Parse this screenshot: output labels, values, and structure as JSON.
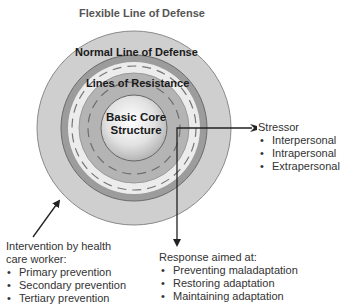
{
  "title": "Flexible Line of Defense",
  "rings": {
    "normal_line": "Normal Line of Defense",
    "lines_of_resistance": "Lines of Resistance",
    "core_line1": "Basic Core",
    "core_line2": "Structure"
  },
  "stressor": {
    "heading": "Stressor",
    "items": [
      "Interpersonal",
      "Intrapersonal",
      "Extrapersonal"
    ]
  },
  "intervention": {
    "heading_line1": "Intervention by health",
    "heading_line2": "care worker:",
    "items": [
      "Primary prevention",
      "Secondary prevention",
      "Tertiary prevention"
    ]
  },
  "response": {
    "heading": "Response aimed at:",
    "items": [
      "Preventing maladaptation",
      "Restoring adaptation",
      "Maintaining adaptation"
    ]
  },
  "colors": {
    "outer_ring": "#cfcfcf",
    "normal_line_ring": "#9a9a9a",
    "white_band": "#ececec",
    "resistance_ring": "#b4b4b4",
    "core": "#d8d8d8",
    "lines": "#222222"
  }
}
